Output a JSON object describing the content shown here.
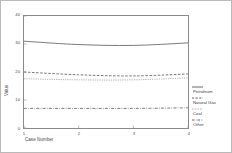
{
  "chart_data": {
    "type": "line",
    "title": "",
    "xlabel": "Case Number",
    "ylabel": "Value",
    "x": [
      1,
      2,
      3,
      4
    ],
    "xlim": [
      1,
      4
    ],
    "ylim": [
      0,
      40
    ],
    "xticks": [
      "1",
      "2",
      "3",
      "4"
    ],
    "yticks": [
      "0",
      "10",
      "20",
      "30",
      "40"
    ],
    "grid": false,
    "legend_position": "right-outside",
    "series": [
      {
        "name": "Petroleum",
        "style": "solid",
        "color": "#555555",
        "values": [
          31.0,
          29.8,
          29.5,
          30.4
        ]
      },
      {
        "name": "Natural Gas",
        "style": "dashed",
        "color": "#555555",
        "values": [
          20.0,
          19.0,
          18.6,
          19.3
        ]
      },
      {
        "name": "Coal",
        "style": "dotted",
        "color": "#777777",
        "values": [
          17.6,
          17.2,
          17.2,
          17.9
        ]
      },
      {
        "name": "Other",
        "style": "dashdot",
        "color": "#555555",
        "values": [
          7.0,
          7.0,
          7.0,
          7.2
        ]
      }
    ]
  },
  "figure": {
    "border_color": "#b9b9b9",
    "plot_border_color": "#8a8a8a",
    "background": "#ffffff"
  }
}
